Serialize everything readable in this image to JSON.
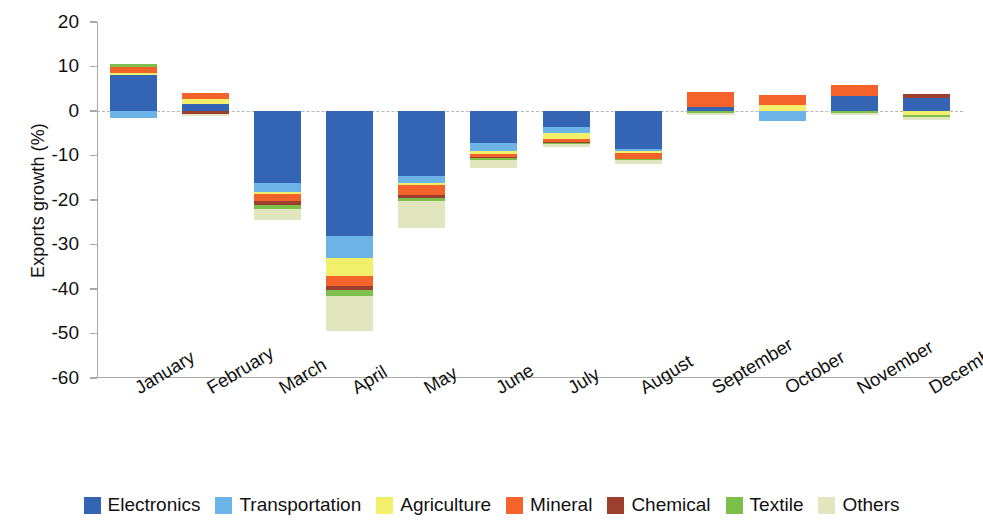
{
  "chart_data": {
    "type": "bar",
    "subtype": "stacked-bar-diverging",
    "title": "",
    "xlabel": "",
    "ylabel": "Exports growth (%)",
    "ylim": [
      -60,
      20
    ],
    "yticks": [
      20,
      10,
      0,
      -10,
      -20,
      -30,
      -40,
      -50,
      -60
    ],
    "ytick_labels": [
      "20",
      "10",
      "0",
      "-10",
      "-20",
      "-30",
      "-40",
      "-50",
      "-60"
    ],
    "grid": false,
    "zero_reference_line": true,
    "legend_position": "bottom",
    "categories": [
      "January",
      "February",
      "March",
      "April",
      "May",
      "June",
      "July",
      "August",
      "September",
      "October",
      "November",
      "December"
    ],
    "series": [
      {
        "name": "Electronics",
        "color": "#3465b4",
        "values": [
          8.0,
          1.6,
          -16.2,
          -28.2,
          -14.6,
          -7.1,
          -3.6,
          -8.6,
          0.9,
          0.0,
          3.4,
          3.0
        ]
      },
      {
        "name": "Transportation",
        "color": "#6cb4e8",
        "values": [
          -1.6,
          0.0,
          -1.9,
          -4.9,
          -1.5,
          -2.0,
          -1.4,
          -0.5,
          0.0,
          -2.2,
          0.0,
          0.0
        ]
      },
      {
        "name": "Agriculture",
        "color": "#f2f06a",
        "values": [
          0.5,
          1.1,
          -0.5,
          -3.9,
          -0.6,
          -0.6,
          -1.4,
          -0.4,
          0.0,
          1.4,
          0.0,
          -1.0
        ]
      },
      {
        "name": "Mineral",
        "color": "#f4642a",
        "values": [
          1.3,
          1.3,
          -1.6,
          -2.3,
          -2.1,
          -0.6,
          -0.5,
          -1.3,
          3.4,
          2.3,
          2.4,
          0.0
        ]
      },
      {
        "name": "Chemical",
        "color": "#9c3f2e",
        "values": [
          0.0,
          -0.6,
          -1.0,
          -1.0,
          -0.8,
          -0.3,
          -0.2,
          0.0,
          0.0,
          0.0,
          0.0,
          0.8
        ]
      },
      {
        "name": "Textile",
        "color": "#7cc04b",
        "values": [
          0.7,
          0.0,
          -0.8,
          -1.2,
          -0.7,
          -0.4,
          -0.3,
          -0.3,
          -0.4,
          0.0,
          -0.4,
          -0.4
        ]
      },
      {
        "name": "Others",
        "color": "#e2e6bf",
        "values": [
          0.0,
          -0.6,
          -2.4,
          -7.9,
          -5.9,
          -1.9,
          -0.7,
          -0.8,
          -0.6,
          0.0,
          -0.5,
          -0.7
        ]
      }
    ]
  },
  "legend": {
    "items": [
      {
        "label": "Electronics",
        "color": "#3465b4"
      },
      {
        "label": "Transportation",
        "color": "#6cb4e8"
      },
      {
        "label": "Agriculture",
        "color": "#f2f06a"
      },
      {
        "label": "Mineral",
        "color": "#f4642a"
      },
      {
        "label": "Chemical",
        "color": "#9c3f2e"
      },
      {
        "label": "Textile",
        "color": "#7cc04b"
      },
      {
        "label": "Others",
        "color": "#e2e6bf"
      }
    ]
  },
  "axes": {
    "y_title": "Exports growth (%)",
    "axis_color": "#a9a9a9",
    "zero_line_color": "#b6b6b6"
  }
}
